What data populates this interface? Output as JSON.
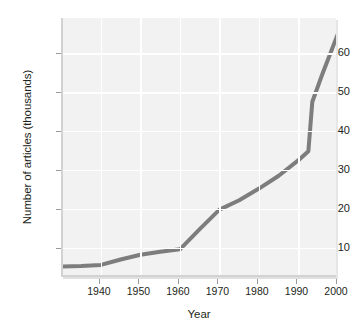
{
  "chart_data": {
    "type": "line",
    "title": "",
    "xlabel": "Year",
    "ylabel": "Number of articles (thousands)",
    "xlim": [
      1930.4,
      2000
    ],
    "ylim": [
      2.5,
      69
    ],
    "xticks": [
      1940,
      1950,
      1960,
      1970,
      1980,
      1990,
      2000
    ],
    "xtick_labels": [
      "1940",
      "1950",
      "1960",
      "1970",
      "1980",
      "1990",
      "2000"
    ],
    "yticks": [
      10,
      20,
      30,
      40,
      50,
      60
    ],
    "ytick_labels": [
      "10",
      "20",
      "30",
      "40",
      "50",
      "60"
    ],
    "grid": true,
    "grid_color": "#ffffff",
    "plot_bgcolor": "#f2f2f2",
    "line_color": "#7d7d7d",
    "line_width": 4,
    "legend": null,
    "series": [
      {
        "name": "Number of articles",
        "x": [
          1930.4,
          1935,
          1940,
          1945,
          1950,
          1955,
          1960,
          1965,
          1970,
          1975,
          1980,
          1985,
          1990,
          1992.5,
          1993.5,
          1996,
          2000
        ],
        "values": [
          5.2,
          5.3,
          5.6,
          7.0,
          8.2,
          9.0,
          9.6,
          14.8,
          19.8,
          22.2,
          25.2,
          28.5,
          32.5,
          34.8,
          47.5,
          54.5,
          65.0
        ]
      }
    ]
  },
  "axes": {
    "x_title": "Year",
    "y_title": "Number of articles (thousands)"
  }
}
